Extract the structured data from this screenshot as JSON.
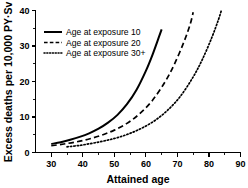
{
  "chart_data": {
    "type": "line",
    "title": "",
    "xlabel": "Attained  age",
    "ylabel": "Excess deaths per 10,000 PY·Sv",
    "xlim": [
      25,
      90
    ],
    "ylim": [
      0,
      40
    ],
    "xticks": [
      30,
      40,
      50,
      60,
      70,
      80,
      90
    ],
    "xticklabels": [
      "30",
      "40",
      "50",
      "60",
      "70",
      "80",
      "90"
    ],
    "yticks": [
      0,
      10,
      20,
      30,
      40
    ],
    "yticklabels": [
      "0",
      "10",
      "20",
      "30",
      "40"
    ],
    "xminorticks": [
      35,
      45,
      55,
      65,
      75,
      85
    ],
    "yminorticks": [
      5,
      15,
      25,
      35
    ],
    "grid": false,
    "legend_position": "upper-left",
    "series": [
      {
        "name": "Age at exposure 10",
        "style": "solid",
        "x": [
          30,
          33,
          36,
          39,
          42,
          45,
          48,
          51,
          54,
          57,
          60,
          62,
          64,
          65
        ],
        "y": [
          2.4,
          2.9,
          3.6,
          4.4,
          5.4,
          6.7,
          8.4,
          10.6,
          13.6,
          17.6,
          23.0,
          27.3,
          32.2,
          34.7
        ]
      },
      {
        "name": "Age at exposure 20",
        "style": "dashed",
        "x": [
          30,
          34,
          38,
          42,
          46,
          50,
          54,
          58,
          62,
          66,
          69,
          72,
          74,
          75
        ],
        "y": [
          1.9,
          2.4,
          3.0,
          3.8,
          4.9,
          6.3,
          8.2,
          10.9,
          14.6,
          19.8,
          24.8,
          31.0,
          36.0,
          39.5
        ]
      },
      {
        "name": "Age at exposure 30+",
        "style": "dotted",
        "x": [
          35,
          39,
          43,
          47,
          51,
          55,
          59,
          63,
          67,
          71,
          75,
          78,
          81,
          83,
          84
        ],
        "y": [
          1.6,
          2.0,
          2.6,
          3.3,
          4.2,
          5.4,
          7.0,
          9.1,
          12.0,
          15.9,
          21.3,
          26.4,
          32.6,
          37.4,
          40.2
        ]
      }
    ]
  },
  "legend": {
    "items": [
      {
        "label": "Age at exposure 10",
        "style": "solid"
      },
      {
        "label": "Age at exposure 20",
        "style": "dashed"
      },
      {
        "label": "Age at exposure 30+",
        "style": "dotted"
      }
    ]
  },
  "colors": {
    "foreground": "#000000",
    "background": "#ffffff"
  }
}
